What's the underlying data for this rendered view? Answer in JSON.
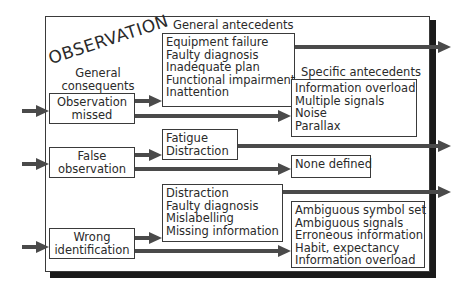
{
  "diagram": {
    "title": "OBSERVATION",
    "headers": {
      "general_consequents": [
        "General",
        "consequents"
      ],
      "general_antecedents": "General antecedents",
      "specific_antecedents": "Specific antecedents"
    },
    "consequents": [
      {
        "label_lines": [
          "Observation",
          "missed"
        ]
      },
      {
        "label_lines": [
          "False",
          "observation"
        ]
      },
      {
        "label_lines": [
          "Wrong",
          "identification"
        ]
      }
    ],
    "general_antecedents": [
      {
        "items": [
          "Equipment failure",
          "Faulty diagnosis",
          "Inadequate plan",
          "Functional impairment",
          "Inattention"
        ]
      },
      {
        "items": [
          "Fatigue",
          "Distraction"
        ]
      },
      {
        "items": [
          "Distraction",
          "Faulty diagnosis",
          "Mislabelling",
          "Missing information"
        ]
      }
    ],
    "specific_antecedents": [
      {
        "items": [
          "Information overload",
          "Multiple signals",
          "Noise",
          "Parallax"
        ]
      },
      {
        "items": [
          "None defined"
        ]
      },
      {
        "items": [
          "Ambiguous symbol set",
          "Ambiguous signals",
          "Erroneous information",
          "Habit, expectancy",
          "Information overload"
        ]
      }
    ],
    "colors": {
      "line": "#4a4a4a",
      "border": "#3a3a3a",
      "shadow": "#1a1a1a",
      "text": "#2a2a2a"
    }
  }
}
